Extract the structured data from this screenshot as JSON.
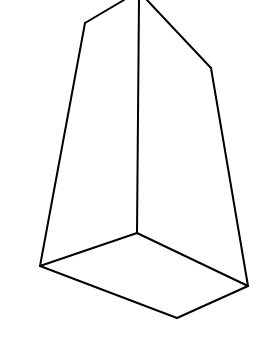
{
  "figure": {
    "type": "3d-wireframe-solid",
    "background": "#ffffff",
    "stroke_color": "#000000",
    "stroke_width": 2,
    "vertices": {
      "top_left_apex": [
        124,
        0
      ],
      "top_right_apex": [
        147,
        0
      ],
      "left_shoulder": [
        85,
        23
      ],
      "right_shoulder": [
        211,
        68
      ],
      "vertical_top": [
        139,
        0
      ],
      "center_bottom": [
        137,
        233
      ],
      "left_bottom": [
        40,
        266
      ],
      "right_bottom": [
        248,
        286
      ],
      "front_bottom": [
        177,
        318
      ]
    },
    "edges": [
      {
        "name": "edge-left-top",
        "from": "top_left_apex",
        "to": "left_shoulder"
      },
      {
        "name": "edge-left-side",
        "from": "left_shoulder",
        "to": "left_bottom"
      },
      {
        "name": "edge-center-vertical",
        "from": "vertical_top",
        "to": "center_bottom"
      },
      {
        "name": "edge-right-top",
        "from": "top_right_apex",
        "to": "right_shoulder"
      },
      {
        "name": "edge-right-side",
        "from": "right_shoulder",
        "to": "right_bottom"
      },
      {
        "name": "edge-base-back-left",
        "from": "left_bottom",
        "to": "center_bottom"
      },
      {
        "name": "edge-base-back-right",
        "from": "center_bottom",
        "to": "right_bottom"
      },
      {
        "name": "edge-base-front-left",
        "from": "left_bottom",
        "to": "front_bottom"
      },
      {
        "name": "edge-base-front-right",
        "from": "front_bottom",
        "to": "right_bottom"
      }
    ]
  }
}
